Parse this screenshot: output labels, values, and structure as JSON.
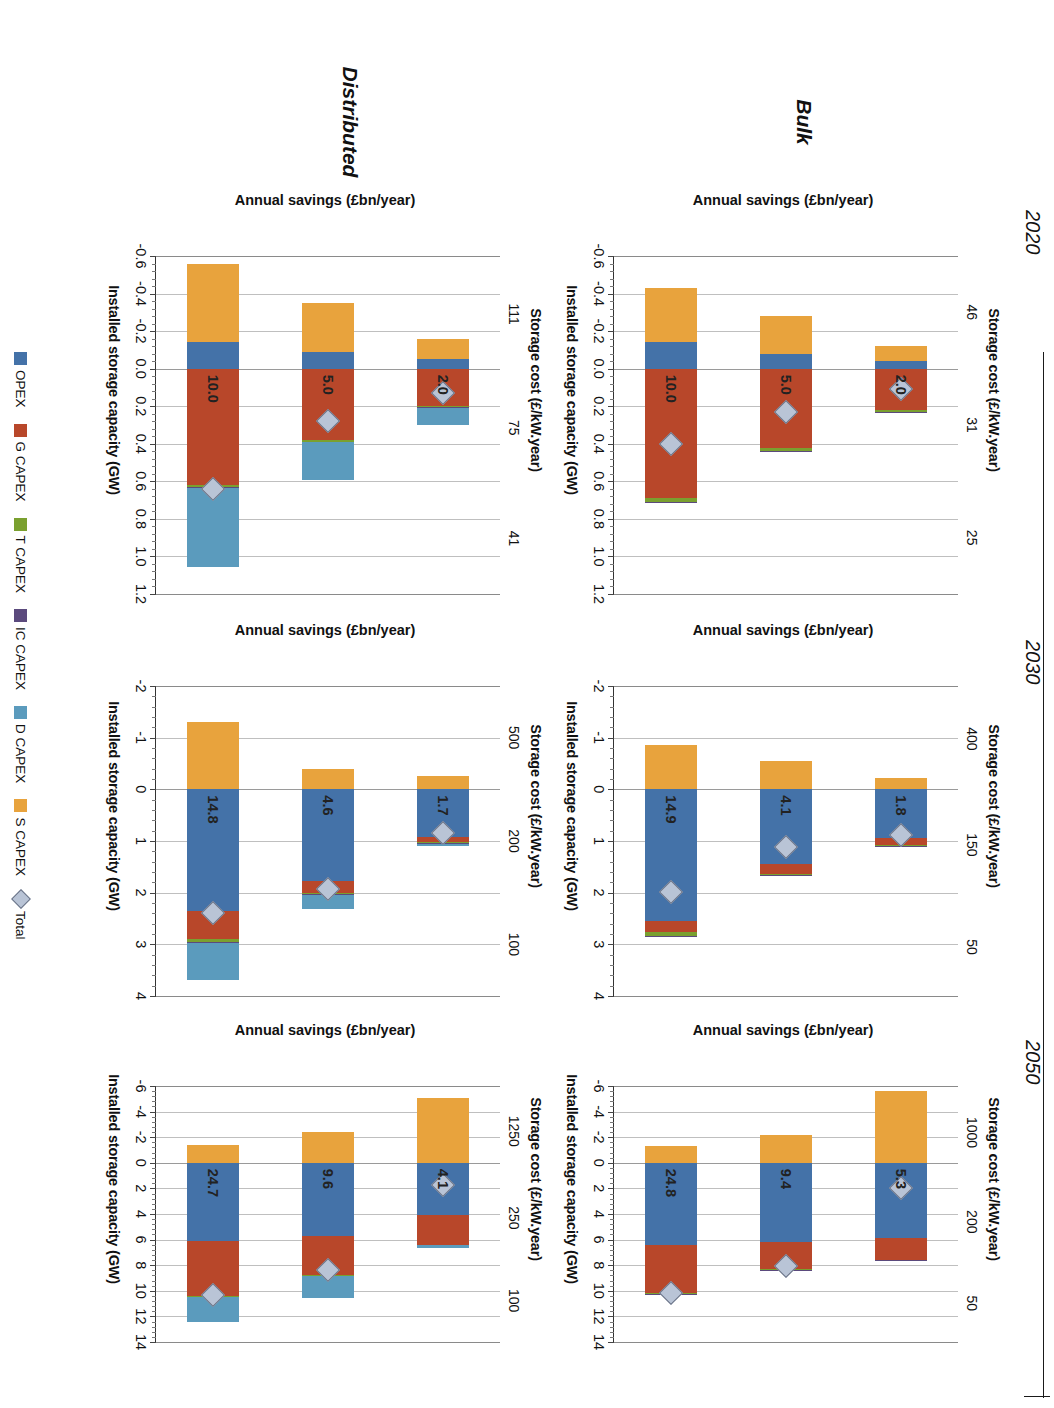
{
  "figure": {
    "row_labels": [
      "Bulk",
      "Distributed"
    ],
    "year_labels": [
      "2020",
      "2030",
      "2050"
    ],
    "top_axis_title": "Storage cost (£/kW.year)",
    "bottom_axis_title": "Installed storage capacity (GW)",
    "value_axis_title": "Annual savings (£bn/year)"
  },
  "legend": {
    "items": [
      {
        "label": "OPEX",
        "color": "#4472a8",
        "marker": "square"
      },
      {
        "label": "G CAPEX",
        "color": "#b8472a",
        "marker": "square"
      },
      {
        "label": "T CAPEX",
        "color": "#7aa02f",
        "marker": "square"
      },
      {
        "label": "IC CAPEX",
        "color": "#5b4a7d",
        "marker": "square"
      },
      {
        "label": "D CAPEX",
        "color": "#5b9bbd",
        "marker": "square"
      },
      {
        "label": "S CAPEX",
        "color": "#e8a33d",
        "marker": "square"
      },
      {
        "label": "Total",
        "color": "#b9c4d6",
        "marker": "diamond"
      }
    ]
  },
  "chart_data": [
    {
      "id": "bulk-2020",
      "type": "bar",
      "orientation": "horizontal-stacked",
      "row": "Bulk",
      "year": "2020",
      "title": "Storage cost (£/kW.year)",
      "xlabel": "Installed storage capacity (GW)",
      "ylabel": "Annual savings (£bn/year)",
      "categories": [
        "46",
        "31",
        "25"
      ],
      "capacity_labels": [
        "2.0",
        "5.0",
        "10.0"
      ],
      "ylim": [
        -0.6,
        1.2
      ],
      "yticks": [
        1.2,
        1.0,
        0.8,
        0.6,
        0.4,
        0.2,
        0.0,
        -0.2,
        -0.4,
        -0.6
      ],
      "grid": true,
      "series": [
        {
          "name": "OPEX",
          "values": [
            -0.04,
            -0.08,
            -0.14
          ]
        },
        {
          "name": "G CAPEX",
          "values": [
            0.22,
            0.42,
            0.69
          ]
        },
        {
          "name": "T CAPEX",
          "values": [
            0.012,
            0.018,
            0.022
          ]
        },
        {
          "name": "IC CAPEX",
          "values": [
            0.004,
            0.005,
            0.006
          ]
        },
        {
          "name": "D CAPEX",
          "values": [
            0.0,
            0.0,
            0.0
          ]
        },
        {
          "name": "S CAPEX",
          "values": [
            -0.08,
            -0.2,
            -0.29
          ]
        }
      ],
      "totals": [
        0.11,
        0.23,
        0.4
      ]
    },
    {
      "id": "bulk-2030",
      "type": "bar",
      "orientation": "horizontal-stacked",
      "row": "Bulk",
      "year": "2030",
      "title": "Storage cost (£/kW.year)",
      "xlabel": "Installed storage capacity (GW)",
      "ylabel": "Annual savings (£bn/year)",
      "categories": [
        "400",
        "150",
        "50"
      ],
      "capacity_labels": [
        "1.8",
        "4.1",
        "14.9"
      ],
      "ylim": [
        -2,
        4
      ],
      "yticks": [
        4,
        3,
        2,
        1,
        0,
        -1,
        -2
      ],
      "grid": true,
      "series": [
        {
          "name": "OPEX",
          "values": [
            0.95,
            1.45,
            2.55
          ]
        },
        {
          "name": "G CAPEX",
          "values": [
            0.12,
            0.18,
            0.22
          ]
        },
        {
          "name": "T CAPEX",
          "values": [
            0.02,
            0.03,
            0.07
          ]
        },
        {
          "name": "IC CAPEX",
          "values": [
            0.01,
            0.01,
            0.02
          ]
        },
        {
          "name": "D CAPEX",
          "values": [
            0.0,
            0.0,
            0.0
          ]
        },
        {
          "name": "S CAPEX",
          "values": [
            -0.22,
            -0.55,
            -0.85
          ]
        }
      ],
      "totals": [
        0.88,
        1.12,
        1.99
      ]
    },
    {
      "id": "bulk-2050",
      "type": "bar",
      "orientation": "horizontal-stacked",
      "row": "Bulk",
      "year": "2050",
      "title": "Storage cost (£/kW.year)",
      "xlabel": "Installed storage capacity (GW)",
      "ylabel": "Annual savings (£bn/year)",
      "categories": [
        "1000",
        "200",
        "50"
      ],
      "capacity_labels": [
        "5.3",
        "9.4",
        "24.8"
      ],
      "ylim": [
        -6,
        14
      ],
      "yticks": [
        14,
        12,
        10,
        8,
        6,
        4,
        2,
        0,
        -2,
        -4,
        -6
      ],
      "grid": true,
      "series": [
        {
          "name": "OPEX",
          "values": [
            5.9,
            6.2,
            6.4
          ]
        },
        {
          "name": "G CAPEX",
          "values": [
            1.7,
            2.1,
            3.8
          ]
        },
        {
          "name": "T CAPEX",
          "values": [
            0.03,
            0.05,
            0.08
          ]
        },
        {
          "name": "IC CAPEX",
          "values": [
            0.01,
            0.02,
            0.03
          ]
        },
        {
          "name": "D CAPEX",
          "values": [
            0.0,
            0.0,
            0.0
          ]
        },
        {
          "name": "S CAPEX",
          "values": [
            -5.6,
            -2.2,
            -1.35
          ]
        }
      ],
      "totals": [
        2.0,
        8.1,
        10.2
      ]
    },
    {
      "id": "distributed-2020",
      "type": "bar",
      "orientation": "horizontal-stacked",
      "row": "Distributed",
      "year": "2020",
      "title": "Storage cost (£/kW.year)",
      "xlabel": "Installed storage capacity (GW)",
      "ylabel": "Annual savings (£bn/year)",
      "categories": [
        "111",
        "75",
        "41"
      ],
      "capacity_labels": [
        "2.0",
        "5.0",
        "10.0"
      ],
      "ylim": [
        -0.6,
        1.2
      ],
      "yticks": [
        1.2,
        1.0,
        0.8,
        0.6,
        0.4,
        0.2,
        0.0,
        -0.2,
        -0.4,
        -0.6
      ],
      "grid": true,
      "series": [
        {
          "name": "OPEX",
          "values": [
            -0.05,
            -0.09,
            -0.14
          ]
        },
        {
          "name": "G CAPEX",
          "values": [
            0.2,
            0.38,
            0.62
          ]
        },
        {
          "name": "T CAPEX",
          "values": [
            0.005,
            0.008,
            0.01
          ]
        },
        {
          "name": "IC CAPEX",
          "values": [
            0.003,
            0.004,
            0.005
          ]
        },
        {
          "name": "D CAPEX",
          "values": [
            0.09,
            0.2,
            0.42
          ]
        },
        {
          "name": "S CAPEX",
          "values": [
            -0.11,
            -0.26,
            -0.42
          ]
        }
      ],
      "totals": [
        0.13,
        0.28,
        0.64
      ]
    },
    {
      "id": "distributed-2030",
      "type": "bar",
      "orientation": "horizontal-stacked",
      "row": "Distributed",
      "year": "2030",
      "title": "Storage cost (£/kW.year)",
      "xlabel": "Installed storage capacity (GW)",
      "ylabel": "Annual savings (£bn/year)",
      "categories": [
        "500",
        "200",
        "100"
      ],
      "capacity_labels": [
        "1.7",
        "4.6",
        "14.8"
      ],
      "ylim": [
        -2,
        4
      ],
      "yticks": [
        4,
        3,
        2,
        1,
        0,
        -1,
        -2
      ],
      "grid": true,
      "series": [
        {
          "name": "OPEX",
          "values": [
            0.92,
            1.78,
            2.35
          ]
        },
        {
          "name": "G CAPEX",
          "values": [
            0.1,
            0.22,
            0.55
          ]
        },
        {
          "name": "T CAPEX",
          "values": [
            0.02,
            0.03,
            0.06
          ]
        },
        {
          "name": "IC CAPEX",
          "values": [
            0.01,
            0.01,
            0.02
          ]
        },
        {
          "name": "D CAPEX",
          "values": [
            0.05,
            0.28,
            0.72
          ]
        },
        {
          "name": "S CAPEX",
          "values": [
            -0.25,
            -0.4,
            -1.3
          ]
        }
      ],
      "totals": [
        0.85,
        1.92,
        2.4
      ]
    },
    {
      "id": "distributed-2050",
      "type": "bar",
      "orientation": "horizontal-stacked",
      "row": "Distributed",
      "year": "2050",
      "title": "Storage cost (£/kW.year)",
      "xlabel": "Installed storage capacity (GW)",
      "ylabel": "Annual savings (£bn/year)",
      "categories": [
        "1250",
        "250",
        "100"
      ],
      "capacity_labels": [
        "4.1",
        "9.6",
        "24.7"
      ],
      "ylim": [
        -6,
        14
      ],
      "yticks": [
        14,
        12,
        10,
        8,
        6,
        4,
        2,
        0,
        -2,
        -4,
        -6
      ],
      "grid": true,
      "series": [
        {
          "name": "OPEX",
          "values": [
            4.1,
            5.7,
            6.1
          ]
        },
        {
          "name": "G CAPEX",
          "values": [
            2.3,
            3.1,
            4.3
          ]
        },
        {
          "name": "T CAPEX",
          "values": [
            0.03,
            0.05,
            0.08
          ]
        },
        {
          "name": "IC CAPEX",
          "values": [
            0.01,
            0.02,
            0.03
          ]
        },
        {
          "name": "D CAPEX",
          "values": [
            0.25,
            1.7,
            1.9
          ]
        },
        {
          "name": "S CAPEX",
          "values": [
            -5.1,
            -2.4,
            -1.4
          ]
        },
        {
          "name": "pad",
          "values": [
            0,
            0,
            0
          ]
        }
      ],
      "totals": [
        1.7,
        8.4,
        10.3
      ]
    }
  ]
}
